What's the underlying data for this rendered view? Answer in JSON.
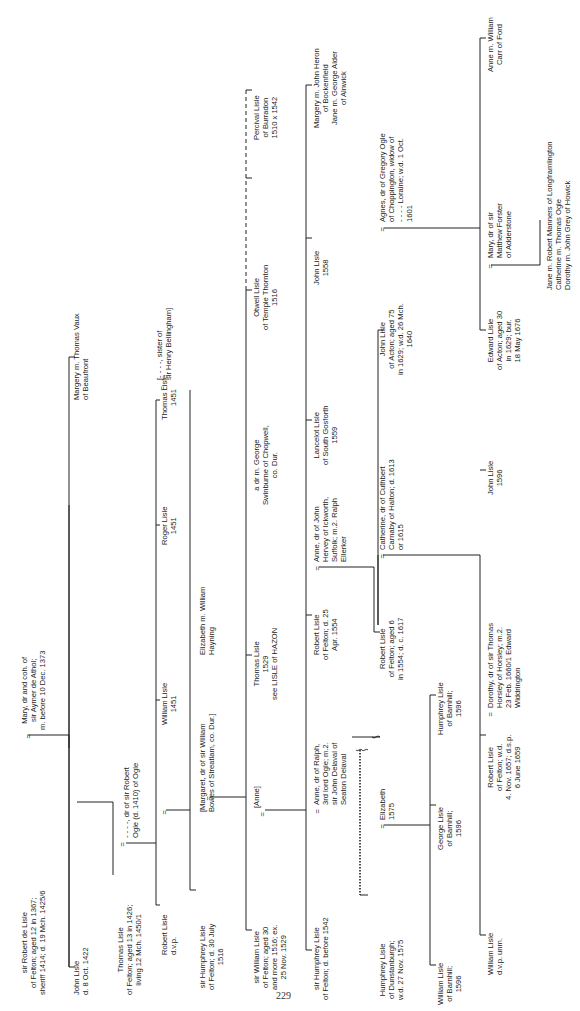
{
  "document": {
    "type": "pedigree chart",
    "family": "Lisle of Felton",
    "orientation": "rotated 90° counter-clockwise",
    "page_number": "229"
  },
  "persons": [
    {
      "id": "robert_de_lisle",
      "text": "sir Robert de Lisle\nof Felton; aged 12 in 1367;\nsheriff 1414; d. 19 Mch. 1425/6"
    },
    {
      "id": "mary_athol",
      "text": "Mary, dr and coh. of\nsir Aymer de Athol;\nm. before 10 Dec. 1373"
    },
    {
      "id": "john_1422",
      "text": "John Lisle\nd. 8 Oct. 1422"
    },
    {
      "id": "margery_vaux",
      "text": "Margery m. Thomas Vaux\nof Beaufront"
    },
    {
      "id": "thomas_1426",
      "text": "Thomas Lisle\nof Felton; aged 13 in 1426;\nliving 12 Mch. 1450/1"
    },
    {
      "id": "ogle_dr",
      "text": "- - - -, dr of sir Robert\nOgle (d. 1410) of Ogle"
    },
    {
      "id": "robert_dvp",
      "text": "Robert Lisle\nd.v.p."
    },
    {
      "id": "william_1451",
      "text": "William Lisle\n1451"
    },
    {
      "id": "roger_1451",
      "text": "Roger Lisle\n1451"
    },
    {
      "id": "thomas_1451",
      "text": "Thomas Lisle\n1451"
    },
    {
      "id": "bellingham",
      "text": "[- - - -, sister of\nsir Henry Bellingham]"
    },
    {
      "id": "humphrey_1516",
      "text": "sir Humphrey Lisle\nof Felton; d. 30 July\n1516"
    },
    {
      "id": "margaret_bowes",
      "text": "[Margaret, dr of sir William\nBowes of Streatlam, co. Dur.]"
    },
    {
      "id": "elizabeth_hayning",
      "text": "Elizabeth m. William\nHayning"
    },
    {
      "id": "william_1529",
      "text": "sir William Lisle\nof Felton; aged 30\nand more 1516; ex.\n25 Nov. 1529"
    },
    {
      "id": "anne_bracket",
      "text": "[Anne]"
    },
    {
      "id": "thomas_1529",
      "text": "Thomas Lisle\n1529\nsee LISLE of HAZON"
    },
    {
      "id": "dr_swinburne",
      "text": "a dr m. George\nSwinburne of Chopwell,\nco. Dur."
    },
    {
      "id": "otwell",
      "text": "Otwell Lisle\nof Temple Thornton\n1516"
    },
    {
      "id": "percival",
      "text": "Percival Lisle\nof Burradon\n1510 x 1542"
    },
    {
      "id": "humphrey_1542",
      "text": "sir Humphrey Lisle\nof Felton; d. before 1542"
    },
    {
      "id": "anne_ogle",
      "text": "Anne, dr of Ralph,\n3rd lord Ogle; m.2.\nsir John Delaval of\nSeaton Delaval"
    },
    {
      "id": "robert_1554",
      "text": "Robert Lisle\nof Felton; d. 25\nApr. 1554"
    },
    {
      "id": "anne_hervey",
      "text": "Anne, dr of John\nHervey of Ickworth,\nSuffolk; m.2. Ralph\nEllerker"
    },
    {
      "id": "lancelot",
      "text": "Lancelot Lisle\nof South Gosforth\n1559"
    },
    {
      "id": "john_1558",
      "text": "John Lisle\n1558"
    },
    {
      "id": "margery_heron",
      "text": "Margery m. John Heron\nof Bockenfield\nJane m. George Alder\nof Alnwick"
    },
    {
      "id": "humphrey_dunstanburgh",
      "text": "Humphrey Lisle\nof Dunstanburgh;\nw.d. 27 Nov. 1575"
    },
    {
      "id": "elizabeth_1575",
      "text": "Elizabeth\n1575"
    },
    {
      "id": "robert_1617",
      "text": "Robert Lisle\nof Felton; aged 6\nin 1554; d. c. 1617"
    },
    {
      "id": "catherine_carnaby",
      "text": "Catherine, dr of Cuthbert\nCarnaby of Halton; d. 1613\nor 1615"
    },
    {
      "id": "john_acton",
      "text": "John Lisle\nof Acton; aged 75\nin 1629; w.d. 26 Mch.\n1640"
    },
    {
      "id": "agnes_ogle",
      "text": "Agnes, dr of Gregory Ogle\nof Choppington, widow of\n- - - - Loraine; w.d. 1 Oct.\n1601"
    },
    {
      "id": "william_barnhill",
      "text": "William Lisle\nof Barnhill;\n1596"
    },
    {
      "id": "george_barnhill",
      "text": "George Lisle\nof Barnhill;\n1596"
    },
    {
      "id": "humphrey_barnhill",
      "text": "Humphrey Lisle\nof Barnhill;\n1596"
    },
    {
      "id": "william_dvp",
      "text": "William Lisle\nd.v.p. unm."
    },
    {
      "id": "robert_1657",
      "text": "Robert Lisle\nof Felton; w.d.\n4. Nov. 1657; d.s.p.\n6 June 1659"
    },
    {
      "id": "dorothy_horsley",
      "text": "Dorothy, dr of sir Thomas\nHorsley of Horsley; m.2.\n23 Feb. 1660/1 Edward\nWiddrington"
    },
    {
      "id": "john_1596",
      "text": "John Lisle\n1596"
    },
    {
      "id": "edward_acton",
      "text": "Edward Lisle\nof Acton; aged 30\nin 1629; bur.\n18 May 1676"
    },
    {
      "id": "mary_forster",
      "text": "Mary, dr of sir\nMatthew Forster\nof Adderstone"
    },
    {
      "id": "anne_carr",
      "text": "Anne m. William\nCarr of Ford"
    },
    {
      "id": "daughters_edward",
      "text": "Jane m. Robert Manners of Longframlington\nCatherine m. Thomas Ogle\nDorothy m. John Grey of Howick"
    }
  ],
  "marriage_sign": "="
}
